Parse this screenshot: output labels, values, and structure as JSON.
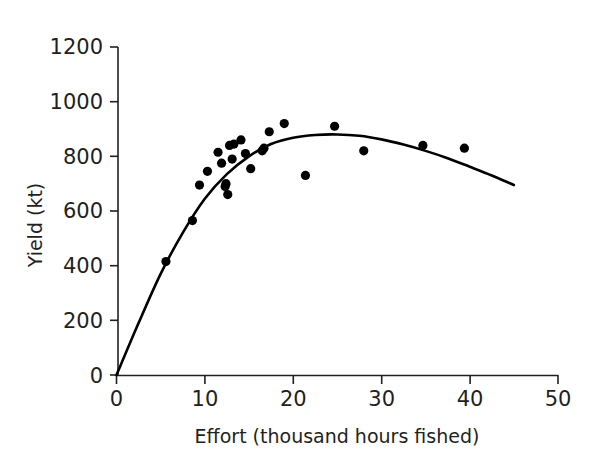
{
  "chart_data": {
    "type": "scatter",
    "title": "",
    "subtitle": "",
    "xlabel": "Effort (thousand hours fished)",
    "ylabel": "Yield (kt)",
    "xlim": [
      0,
      50
    ],
    "ylim": [
      0,
      1200
    ],
    "xticks": [
      0,
      10,
      20,
      30,
      40,
      50
    ],
    "yticks": [
      0,
      200,
      400,
      600,
      800,
      1000,
      1200
    ],
    "xtick_labels": [
      "0",
      "10",
      "20",
      "30",
      "40",
      "50"
    ],
    "ytick_labels": [
      "0",
      "200",
      "400",
      "600",
      "800",
      "1000",
      "1200"
    ],
    "grid": false,
    "legend": null,
    "annotations": [],
    "series": [
      {
        "name": "Observed yield",
        "type": "scatter",
        "marker": "filled-circle",
        "color": "#000000",
        "points": [
          {
            "x": 5.6,
            "y": 415
          },
          {
            "x": 8.6,
            "y": 565
          },
          {
            "x": 9.4,
            "y": 695
          },
          {
            "x": 10.3,
            "y": 745
          },
          {
            "x": 11.5,
            "y": 815
          },
          {
            "x": 11.9,
            "y": 775
          },
          {
            "x": 12.3,
            "y": 690
          },
          {
            "x": 12.4,
            "y": 700
          },
          {
            "x": 12.6,
            "y": 660
          },
          {
            "x": 12.8,
            "y": 840
          },
          {
            "x": 13.1,
            "y": 790
          },
          {
            "x": 13.3,
            "y": 845
          },
          {
            "x": 14.1,
            "y": 860
          },
          {
            "x": 14.6,
            "y": 810
          },
          {
            "x": 15.2,
            "y": 755
          },
          {
            "x": 16.5,
            "y": 820
          },
          {
            "x": 16.7,
            "y": 830
          },
          {
            "x": 17.3,
            "y": 890
          },
          {
            "x": 19.0,
            "y": 920
          },
          {
            "x": 21.4,
            "y": 730
          },
          {
            "x": 24.7,
            "y": 910
          },
          {
            "x": 28.0,
            "y": 820
          },
          {
            "x": 34.7,
            "y": 840
          },
          {
            "x": 39.4,
            "y": 830
          }
        ]
      },
      {
        "name": "Fitted surplus-production curve",
        "type": "line",
        "color": "#000000",
        "x_start": 0,
        "x_end": 45,
        "peak_x": 25,
        "peak_y": 880,
        "end_y": 695,
        "points": [
          {
            "x": 0,
            "y": 0
          },
          {
            "x": 2.5,
            "y": 190
          },
          {
            "x": 5,
            "y": 370
          },
          {
            "x": 7.5,
            "y": 520
          },
          {
            "x": 10,
            "y": 645
          },
          {
            "x": 12.5,
            "y": 735
          },
          {
            "x": 15,
            "y": 800
          },
          {
            "x": 17.5,
            "y": 845
          },
          {
            "x": 20,
            "y": 868
          },
          {
            "x": 22.5,
            "y": 878
          },
          {
            "x": 25,
            "y": 880
          },
          {
            "x": 27.5,
            "y": 875
          },
          {
            "x": 30,
            "y": 862
          },
          {
            "x": 32.5,
            "y": 843
          },
          {
            "x": 35,
            "y": 820
          },
          {
            "x": 37.5,
            "y": 793
          },
          {
            "x": 40,
            "y": 762
          },
          {
            "x": 42.5,
            "y": 730
          },
          {
            "x": 45,
            "y": 695
          }
        ]
      }
    ]
  },
  "axes": {
    "y_axis_title": "Yield (kt)",
    "x_axis_title": "Effort (thousand hours fished)"
  }
}
